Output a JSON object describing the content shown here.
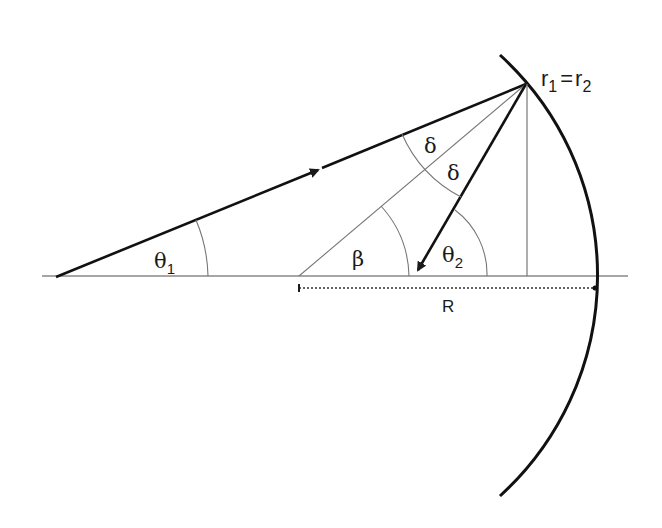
{
  "diagram": {
    "labels": {
      "r_eq": {
        "r1": "r",
        "sub1": "1",
        "eq": "=",
        "r2": "r",
        "sub2": "2"
      },
      "theta1": {
        "sym": "θ",
        "sub": "1"
      },
      "theta2": {
        "sym": "θ",
        "sub": "2"
      },
      "beta": "β",
      "delta_upper": "δ",
      "delta_lower": "δ",
      "radius": "R"
    },
    "colors": {
      "thick_line": "#1a1a1a",
      "thin_line": "#777777",
      "axis": "#888888",
      "background": "#ffffff"
    },
    "geometry": {
      "axis_y": 276,
      "axis_x_start": 42,
      "axis_x_end": 628,
      "source_point": [
        56,
        277
      ],
      "reflection_point": [
        526,
        84
      ],
      "center_point": [
        299,
        276
      ],
      "radius_px": 298,
      "normal_foot": [
        527,
        276
      ]
    }
  }
}
